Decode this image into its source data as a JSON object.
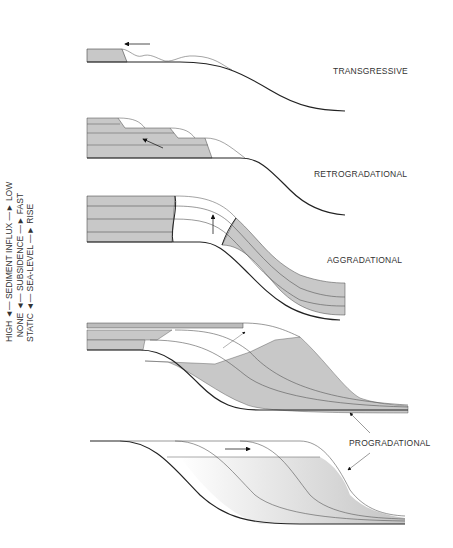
{
  "diagram": {
    "axis_labels": [
      {
        "low_end": "HIGH",
        "name": "SEDIMENT INFLUX",
        "high_end": "LOW"
      },
      {
        "low_end": "NONE",
        "name": "SUBSIDENCE",
        "high_end": "FAST"
      },
      {
        "low_end": "STATIC",
        "name": "SEA-LEVEL",
        "high_end": "RISE"
      }
    ],
    "panels": [
      {
        "id": "transgressive",
        "label": "TRANSGRESSIVE"
      },
      {
        "id": "retrogradational",
        "label": "RETROGRADATIONAL"
      },
      {
        "id": "aggradational",
        "label": "AGGRADATIONAL"
      },
      {
        "id": "progradational",
        "label": "PROGRADATIONAL"
      }
    ],
    "arrow_glyph": "→",
    "colors": {
      "fill": "#c8c8c8",
      "line": "#222222",
      "thin": "#555555"
    }
  }
}
